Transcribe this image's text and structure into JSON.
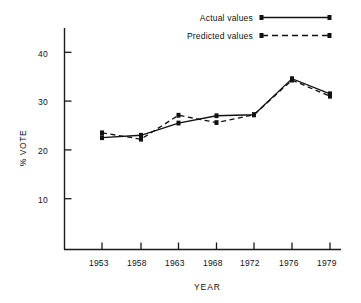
{
  "chart_data": {
    "type": "line",
    "title": "",
    "xlabel": "YEAR",
    "ylabel": "% VOTE",
    "categories": [
      "1953",
      "1958",
      "1963",
      "1968",
      "1972",
      "1976",
      "1979"
    ],
    "x": [
      1953,
      1958,
      1963,
      1968,
      1972,
      1976,
      1979
    ],
    "xtick_labels": [
      "1953",
      "1958",
      "1963",
      "1968",
      "1972",
      "1976",
      "1979"
    ],
    "ytick_labels": [
      "10",
      "20",
      "30",
      "40"
    ],
    "yticks": [
      10,
      20,
      30,
      40
    ],
    "ylim": [
      0,
      45
    ],
    "grid": false,
    "legend_position": "top-right",
    "series": [
      {
        "name": "Actual values",
        "style": "solid",
        "marker": "filled-square",
        "color": "#111111",
        "values": [
          22.5,
          23.0,
          25.5,
          27.0,
          27.2,
          34.6,
          31.5
        ]
      },
      {
        "name": "Predicted values",
        "style": "dashed",
        "marker": "filled-square",
        "color": "#111111",
        "values": [
          23.5,
          22.2,
          27.1,
          25.6,
          27.2,
          34.3,
          31.0
        ]
      }
    ]
  },
  "legend": {
    "items": [
      {
        "label": "Actual values",
        "style": "solid"
      },
      {
        "label": "Predicted values",
        "style": "dashed"
      }
    ]
  },
  "axes": {
    "y_axis_title": "% VOTE",
    "x_axis_title": "YEAR"
  }
}
